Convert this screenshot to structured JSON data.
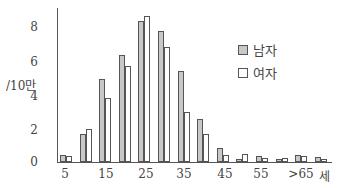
{
  "chart_data": {
    "type": "bar",
    "title": "",
    "xlabel": "세",
    "ylabel": "/10만",
    "ylim": [
      0,
      9
    ],
    "yticks": [
      "0",
      "2",
      "4",
      "6",
      "8"
    ],
    "xtick_labels": [
      "5",
      "15",
      "25",
      "35",
      "45",
      "55",
      ">65",
      "세"
    ],
    "categories": [
      "5",
      "10",
      "15",
      "20",
      "25",
      "30",
      "35",
      "40",
      "45",
      "50",
      "55",
      "60",
      "65",
      ">65"
    ],
    "series": [
      {
        "name": "남자",
        "color": "#c8c8c8",
        "values": [
          0.4,
          1.6,
          4.8,
          6.2,
          8.2,
          7.6,
          5.3,
          2.5,
          0.8,
          0.2,
          0.35,
          0.15,
          0.4,
          0.3
        ]
      },
      {
        "name": "여자",
        "color": "#ffffff",
        "values": [
          0.35,
          1.9,
          3.7,
          5.6,
          8.5,
          6.7,
          2.9,
          1.6,
          0.4,
          0.45,
          0.25,
          0.25,
          0.35,
          0.2
        ]
      }
    ],
    "legend_position": "upper right",
    "grid": false
  }
}
